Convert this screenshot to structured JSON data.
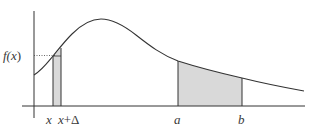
{
  "diagram": {
    "type": "probability-density-curve",
    "colors": {
      "line": "#333333",
      "shade": "#d9d9d9",
      "background": "#ffffff"
    },
    "labels": {
      "f_label_main": "f(",
      "f_label_var": "x",
      "f_label_close": ")",
      "x_tick": "x",
      "x_delta_var": "x",
      "x_delta_op": "+Δ",
      "a_tick": "a",
      "b_tick": "b"
    }
  }
}
